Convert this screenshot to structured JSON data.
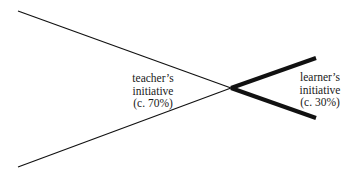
{
  "diagram": {
    "teacher": {
      "line1": "teacher’s",
      "line2": "initiative",
      "line3": "(c. 70%)",
      "share_percent": 70
    },
    "learner": {
      "line1": "learner’s",
      "line2": "initiative",
      "line3": "(c. 30%)",
      "share_percent": 30
    },
    "colors": {
      "line": "#111111",
      "text": "#1a1a1a",
      "background": "#ffffff"
    }
  }
}
